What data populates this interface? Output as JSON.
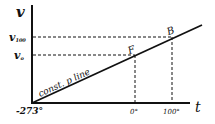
{
  "diagram": {
    "y_axis_label": "v",
    "x_axis_label": "t",
    "y_ticks": [
      {
        "label_main": "v",
        "label_sub": "100",
        "y": 37
      },
      {
        "label_main": "v",
        "label_sub": "o",
        "y": 55
      }
    ],
    "x_ticks": [
      {
        "label": "0°",
        "x": 135
      },
      {
        "label": "100°",
        "x": 172
      }
    ],
    "origin_label": "-273°",
    "line_label": "const. p line",
    "points": [
      {
        "label": "F",
        "x": 135,
        "y": 55
      },
      {
        "label": "B",
        "x": 172,
        "y": 37
      }
    ],
    "colors": {
      "ink": "#111111",
      "background": "#ffffff"
    }
  }
}
